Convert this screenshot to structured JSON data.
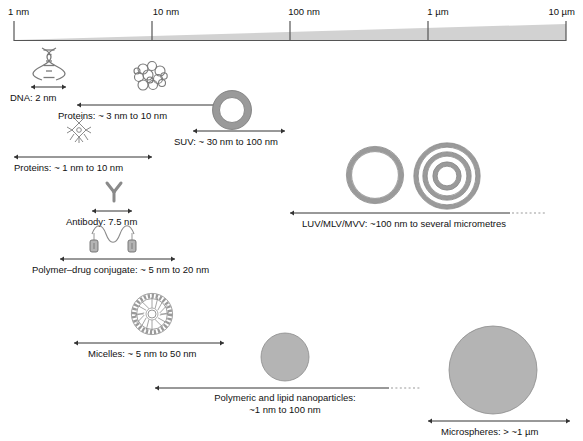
{
  "figure": {
    "colors": {
      "wedge_fill": "#d2d2d2",
      "particle_fill": "#b4b4b4",
      "particle_stroke": "#8c8c8c",
      "line": "#333333",
      "icon_stroke": "#6e6e6e",
      "axis": "#555555",
      "text": "#111111"
    }
  },
  "scale": {
    "name": "size-axis",
    "ticks": [
      {
        "label": "1 nm",
        "x": 14
      },
      {
        "label": "10 nm",
        "x": 152
      },
      {
        "label": "100 nm",
        "x": 290
      },
      {
        "label": "1 µm",
        "x": 428
      },
      {
        "label": "10 µm",
        "x": 566
      }
    ]
  },
  "entries": [
    {
      "id": "dna",
      "icon": "dna-helix-icon",
      "label": "DNA: 2 nm",
      "range_text": "2 nm",
      "bar": {
        "x1": 31,
        "x2": 66,
        "open_end": false
      }
    },
    {
      "id": "proteins-globular",
      "icon": "protein-blob-icon",
      "label": "Proteins: ~ 3 nm to 10 nm",
      "range_text": "~ 3 nm to 10 nm",
      "bar": {
        "x1": 77,
        "x2": 220,
        "open_end": false
      }
    },
    {
      "id": "suv",
      "icon": "vesicle-ring-icon",
      "label": "SUV: ~ 30 nm to 100 nm",
      "range_text": "~ 30 nm to 100 nm",
      "bar": {
        "x1": 193,
        "x2": 285,
        "open_end": false
      }
    },
    {
      "id": "proteins-star",
      "icon": "protein-star-icon",
      "label": "Proteins: ~ 1 nm to 10 nm",
      "range_text": "~ 1 nm to 10 nm",
      "bar": {
        "x1": 14,
        "x2": 152,
        "open_end": false
      }
    },
    {
      "id": "antibody",
      "icon": "antibody-y-icon",
      "label": "Antibody: 7.5 nm",
      "range_text": "7.5 nm",
      "bar": {
        "x1": 92,
        "x2": 132,
        "open_end": false
      }
    },
    {
      "id": "luv-mlv-mvv",
      "icon": "multilamellar-vesicle-icon",
      "label": "LUV/MLV/MVV: ~100 nm to several micrometres",
      "range_text": "~100 nm to several micrometres",
      "bar": {
        "x1": 290,
        "x2": 545,
        "open_end": true
      }
    },
    {
      "id": "polymer-drug-conjugate",
      "icon": "polymer-drug-conjugate-icon",
      "label": "Polymer–drug conjugate: ~ 5 nm to 20 nm",
      "range_text": "~ 5 nm to 20 nm",
      "bar": {
        "x1": 60,
        "x2": 175,
        "open_end": false
      }
    },
    {
      "id": "micelles",
      "icon": "micelle-icon",
      "label": "Micelles: ~ 5 nm to 50 nm",
      "range_text": "~ 5 nm to 50 nm",
      "bar": {
        "x1": 74,
        "x2": 224,
        "open_end": false
      }
    },
    {
      "id": "nanoparticles",
      "icon": "nanoparticle-circle-icon",
      "label_line1": "Polymeric and lipid nanoparticles:",
      "label_line2": "~1 nm to 100 nm",
      "bar": {
        "x1": 155,
        "x2": 420,
        "open_end": true
      }
    },
    {
      "id": "microspheres",
      "icon": "microsphere-circle-icon",
      "label": "Microspheres: > ~1 µm",
      "range_text": "> ~1 µm",
      "bar": {
        "x1": 428,
        "x2": 570,
        "open_end": false
      }
    }
  ]
}
